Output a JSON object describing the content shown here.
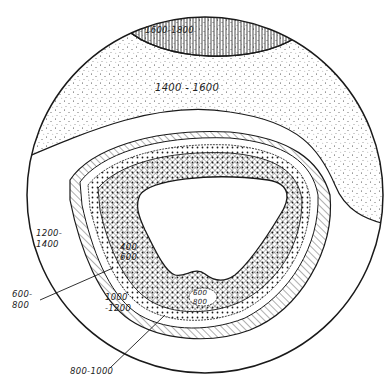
{
  "diagram": {
    "type": "contour-cross-section",
    "boundary": "circle",
    "colors": {
      "ink": "#1a1a1a",
      "background": "#ffffff"
    },
    "zones": [
      {
        "id": "z1600",
        "range": "1600-1800",
        "pattern": "vertical-lines",
        "position": "top cap"
      },
      {
        "id": "z1400",
        "range": "1400 - 1600",
        "pattern": "stipple-dots",
        "position": "upper band"
      },
      {
        "id": "z1200",
        "range_line1": "1200-",
        "range_line2": "1400",
        "pattern": "blank",
        "position": "middle band"
      },
      {
        "id": "z1000",
        "range_line1": "1000",
        "range_line2": "-1200",
        "pattern": "diagonal-hatch",
        "position": "outer ring"
      },
      {
        "id": "z800",
        "range": "800-1000",
        "pattern": "blank-thin-ring",
        "position": "thin ring with leader"
      },
      {
        "id": "z600",
        "range_line1": "600-",
        "range_line2": "800",
        "pattern": "dotted",
        "position": "dotted ring with leader"
      },
      {
        "id": "z400",
        "range_line1": "400",
        "range_line2": "600",
        "pattern": "crosshatch",
        "position": "inner ring"
      },
      {
        "id": "zisland",
        "range_line1": "600",
        "range_line2": "800",
        "pattern": "enclosed-oval",
        "position": "island in inner ring"
      },
      {
        "id": "zcore",
        "range": "",
        "pattern": "blank",
        "position": "central cavity"
      }
    ]
  }
}
